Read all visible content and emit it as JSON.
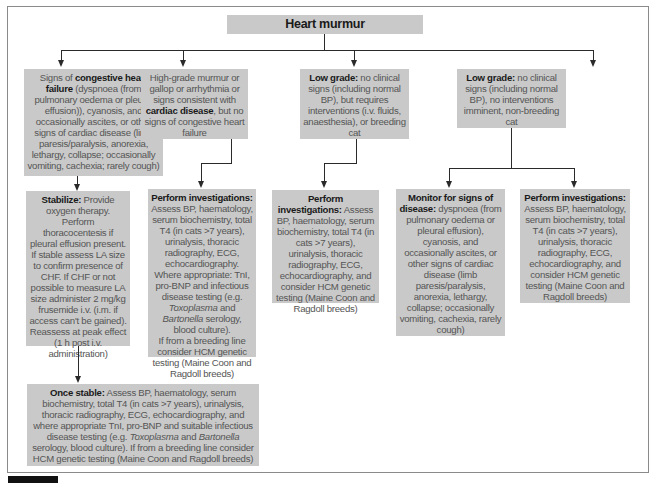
{
  "title": "Heart murmur",
  "nodes": {
    "chf": {
      "pre": "Signs of ",
      "bold": "congestive heart failure",
      "post": " (dyspnoea (from pulmonary oedema or pleural effusion)), cyanosis, and occasionally ascites, or other signs of cardiac disease (limb paresis/paralysis, anorexia, lethargy, collapse; occasionally vomiting, cachexia; rarely cough)"
    },
    "highgrade": {
      "pre": "High-grade murmur or gallop or arrhythmia or signs consistent with ",
      "bold": "cardiac disease",
      "post": ", but no signs of congestive heart failure"
    },
    "lowgrade_breeding": {
      "bold": "Low grade:",
      "post": " no clinical signs (including normal BP), but requires interventions (i.v. fluids, anaesthesia), or breeding cat"
    },
    "lowgrade_nonbreeding": {
      "bold": "Low grade:",
      "post": " no clinical signs (including normal BP), no interventions imminent, non-breeding cat"
    },
    "stabilize": {
      "bold": "Stabilize:",
      "post": " Provide oxygen therapy. Perform thoracocentesis if pleural effusion present. If stable assess LA size to confirm presence of CHF. If CHF or not possible to measure LA size administer 2 mg/kg frusemide i.v. (i.m. if access can't be gained). Reassess at peak effect (1 h post i.v. administration)"
    },
    "invest_cardiac": {
      "bold": "Perform investigations:",
      "p1": " Assess BP, haematology, serum biochemistry, total T4 (in cats >7 years), urinalysis, thoracic radiography, ECG, echocardiography. Where appropriate: TnI, pro-BNP and infectious disease testing (e.g. ",
      "i1": "Toxoplasma",
      "p2": " and ",
      "i2": "Bartonella",
      "p3": " serology, blood culture).",
      "p4": "If from a breeding line consider HCM genetic testing (Maine Coon and Ragdoll breeds)"
    },
    "invest_lowgrade": {
      "bold": "Perform investigations:",
      "post": " Assess BP, haematology, serum biochemistry,  total T4 (in cats >7 years), urinalysis, thoracic radiography, ECG, echocardiography, and consider HCM genetic testing (Maine Coon and Ragdoll breeds)"
    },
    "monitor": {
      "bold": "Monitor for signs of disease:",
      "post": " dyspnoea (from pulmonary oedema or pleural effusion), cyanosis, and occasionally ascites, or other signs of cardiac disease (limb paresis/paralysis, anorexia, lethargy, collapse; occasionally vomiting, cachexia, rarely cough)"
    },
    "invest_nonbreeding": {
      "bold": "Perform investigations:",
      "post": " Assess BP, haematology, serum biochemistry,  total T4 (in cats >7 years), urinalysis, thoracic radiography, ECG, echocardiography, and consider HCM genetic testing  (Maine Coon and Ragdoll breeds)"
    },
    "once_stable": {
      "bold": "Once stable:",
      "p1": " Assess BP, haematology, serum biochemistry,  total T4 (in cats >7 years), urinalysis, thoracic radiography, ECG, echocardiography, and where appropriate TnI, pro-BNP and suitable infectious disease testing (e.g. ",
      "i1": "Toxoplasma",
      "p2": " and ",
      "i2": "Bartonella",
      "p3": " serology, blood culture). If from a breeding line consider HCM genetic testing (Maine Coon and Ragdoll breeds)"
    }
  }
}
